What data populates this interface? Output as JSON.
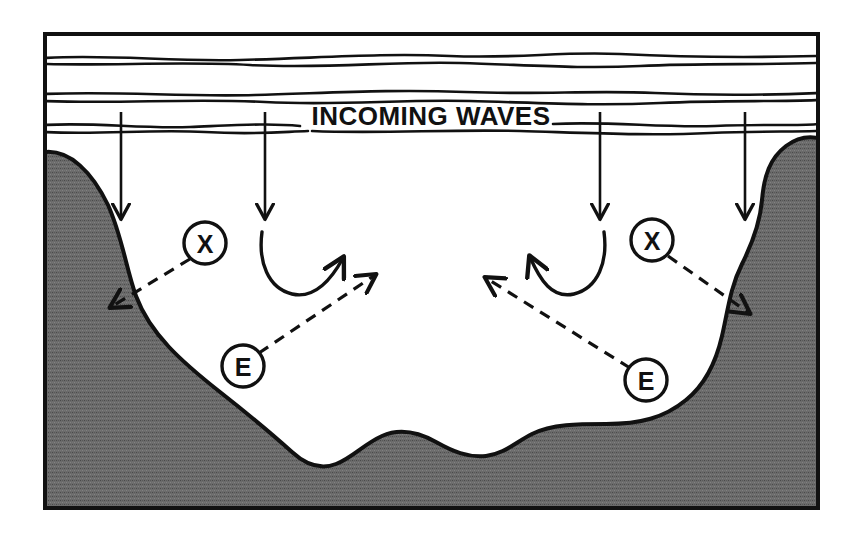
{
  "figure": {
    "type": "coastal-wave-erosion-diagram",
    "caption_text": "INCOMING WAVES",
    "background_color": "#ffffff",
    "ink_color": "#111111",
    "landmass_fill_color": "#6b6b6b",
    "water_fill_color": "#ffffff"
  },
  "frame": {
    "x": 45,
    "y": 34,
    "width": 773,
    "height": 474,
    "stroke_width": 4
  },
  "labels": {
    "incoming_waves": "INCOMING WAVES"
  },
  "markers": [
    {
      "id": "x-left",
      "label": "X",
      "cx": 205,
      "cy": 243,
      "r": 21
    },
    {
      "id": "x-right",
      "label": "X",
      "cx": 652,
      "cy": 240,
      "r": 21
    },
    {
      "id": "e-left",
      "label": "E",
      "cx": 243,
      "cy": 366,
      "r": 21
    },
    {
      "id": "e-right",
      "label": "E",
      "cx": 646,
      "cy": 380,
      "r": 21
    }
  ],
  "wave_lines": [
    {
      "id": "wave-line-1",
      "y": 60
    },
    {
      "id": "wave-line-2",
      "y": 97
    },
    {
      "id": "wave-line-3",
      "y": 130
    }
  ],
  "incoming_wave_arrows": [
    {
      "id": "incoming-arrow-1",
      "x": 121,
      "y_start": 112,
      "y_end": 222
    },
    {
      "id": "incoming-arrow-2",
      "x": 265,
      "y_start": 112,
      "y_end": 222
    },
    {
      "id": "incoming-arrow-3",
      "x": 600,
      "y_start": 112,
      "y_end": 222
    },
    {
      "id": "incoming-arrow-4",
      "x": 745,
      "y_start": 112,
      "y_end": 222
    }
  ],
  "circulation_arrows": [
    {
      "id": "circulation-left",
      "direction": "clockwise-up-right"
    },
    {
      "id": "circulation-right",
      "direction": "counterclockwise-up-left"
    }
  ],
  "erosion_arrows": [
    {
      "id": "x-left-arrow",
      "from": "x-left",
      "to_x": 108,
      "to_y": 310,
      "style": "dashed"
    },
    {
      "id": "x-right-arrow",
      "from": "x-right",
      "to_x": 752,
      "to_y": 316,
      "style": "dashed"
    },
    {
      "id": "e-left-arrow",
      "from": "e-left",
      "to_x": 378,
      "to_y": 272,
      "style": "dashed"
    },
    {
      "id": "e-right-arrow",
      "from": "e-right",
      "to_x": 483,
      "to_y": 275,
      "style": "dashed"
    }
  ]
}
